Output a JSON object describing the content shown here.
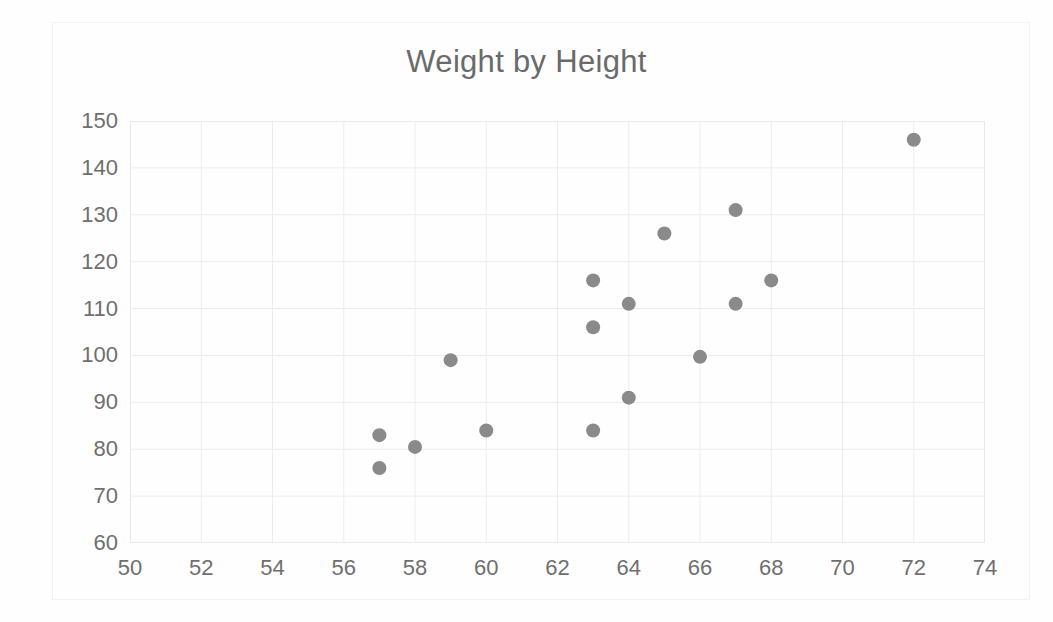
{
  "chart_data": {
    "type": "scatter",
    "title": "Weight by Height",
    "xlabel": "",
    "ylabel": "",
    "xlim": [
      50,
      74
    ],
    "ylim": [
      60,
      150
    ],
    "xticks": [
      50,
      52,
      54,
      56,
      58,
      60,
      62,
      64,
      66,
      68,
      70,
      72,
      74
    ],
    "yticks": [
      60,
      70,
      80,
      90,
      100,
      110,
      120,
      130,
      140,
      150
    ],
    "grid": true,
    "legend": false,
    "marker_color": "#8a8a8a",
    "gridline_color": "#ececec",
    "title_color": "#6a6a6a",
    "tick_label_color": "#6f6f6f",
    "series": [
      {
        "name": "Weight",
        "points": [
          {
            "x": 57,
            "y": 83
          },
          {
            "x": 57,
            "y": 76
          },
          {
            "x": 58,
            "y": 80.5
          },
          {
            "x": 59,
            "y": 99
          },
          {
            "x": 60,
            "y": 84
          },
          {
            "x": 63,
            "y": 116
          },
          {
            "x": 63,
            "y": 106
          },
          {
            "x": 63,
            "y": 84
          },
          {
            "x": 64,
            "y": 111
          },
          {
            "x": 64,
            "y": 91
          },
          {
            "x": 65,
            "y": 126
          },
          {
            "x": 66,
            "y": 99.7
          },
          {
            "x": 67,
            "y": 131
          },
          {
            "x": 67,
            "y": 111
          },
          {
            "x": 68,
            "y": 116
          },
          {
            "x": 72,
            "y": 146
          }
        ]
      }
    ]
  }
}
